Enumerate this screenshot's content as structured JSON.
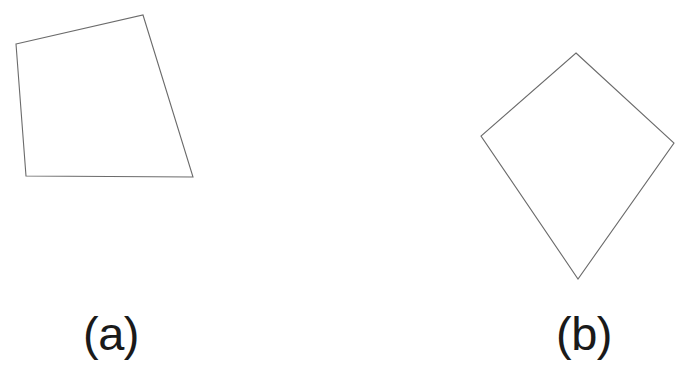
{
  "figure": {
    "background_color": "#ffffff",
    "stroke_color": "#6b6b6b",
    "caption_color": "#1a1a1a",
    "canvas": {
      "width": 688,
      "height": 375
    },
    "panels": [
      {
        "id": "panel-a",
        "caption": "(a)",
        "shape_name": "irregular-quadrilateral",
        "vertices": [
          [
            16,
            44
          ],
          [
            143,
            15
          ],
          [
            193,
            177
          ],
          [
            26,
            176
          ]
        ],
        "points_attr": "16,44 143,15 193,177 26,176",
        "caption_position": [
          111,
          352
        ]
      },
      {
        "id": "panel-b",
        "caption": "(b)",
        "shape_name": "kite-quadrilateral",
        "vertices": [
          [
            576,
            53
          ],
          [
            674,
            143
          ],
          [
            578,
            279
          ],
          [
            481,
            136
          ]
        ],
        "points_attr": "576,53 674,143 578,279 481,136",
        "caption_position": [
          584,
          352
        ]
      }
    ]
  }
}
